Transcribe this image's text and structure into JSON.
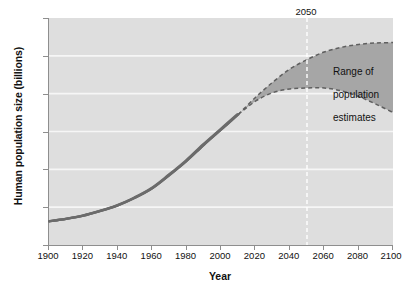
{
  "chart_data": {
    "type": "area",
    "title": "",
    "xlabel": "Year",
    "ylabel": "Human population size (billions)",
    "xlim": [
      1900,
      2100
    ],
    "ylim": [
      0,
      12
    ],
    "xticks": [
      1900,
      1920,
      1940,
      1960,
      1980,
      2000,
      2020,
      2040,
      2060,
      2080,
      2100
    ],
    "yticks": [
      0,
      2,
      4,
      6,
      8,
      10,
      12
    ],
    "grid": "horizontal-white-gridlines",
    "legend": "none",
    "annotations": [
      {
        "name": "marker-2050",
        "text": "2050",
        "x": 2050,
        "style": "white-dashed-vertical-line"
      },
      {
        "name": "range-note",
        "text": "Range of\npopulation\nestimates",
        "x": 2065,
        "y": 9.3
      }
    ],
    "series": [
      {
        "name": "Historical population",
        "style": "solid-dark-line",
        "x": [
          1900,
          1910,
          1920,
          1930,
          1940,
          1950,
          1960,
          1970,
          1980,
          1990,
          2000,
          2010
        ],
        "values": [
          1.25,
          1.38,
          1.55,
          1.8,
          2.1,
          2.5,
          3.0,
          3.7,
          4.45,
          5.3,
          6.1,
          6.9
        ]
      },
      {
        "name": "High estimate",
        "style": "dashed-upper-bound",
        "x": [
          2010,
          2020,
          2030,
          2040,
          2050,
          2060,
          2070,
          2080,
          2090,
          2100
        ],
        "values": [
          6.9,
          7.8,
          8.6,
          9.3,
          9.8,
          10.2,
          10.45,
          10.6,
          10.68,
          10.7
        ]
      },
      {
        "name": "Low estimate",
        "style": "dashed-lower-bound",
        "x": [
          2010,
          2020,
          2030,
          2040,
          2050,
          2060,
          2070,
          2080,
          2090,
          2100
        ],
        "values": [
          6.9,
          7.6,
          8.05,
          8.25,
          8.3,
          8.3,
          8.15,
          7.85,
          7.45,
          7.0
        ]
      }
    ],
    "colors": {
      "plot_background": "#dedede",
      "range_band": "#a8a8a8",
      "line": "#6b6b6b",
      "gridline": "#f4f4f4",
      "axis": "#8e8e8e",
      "text": "#111111"
    }
  },
  "axes": {
    "y_title": "Human population size (billions)",
    "x_title": "Year",
    "y_tick_labels": [
      "12",
      "10",
      "8",
      "6",
      "4",
      "2",
      "0"
    ],
    "x_tick_labels": [
      "1900",
      "1920",
      "1940",
      "1960",
      "1980",
      "2000",
      "2020",
      "2040",
      "2060",
      "2080",
      "2100"
    ]
  },
  "annotations": {
    "year_marker": "2050",
    "range_line1": "Range of",
    "range_line2": "population",
    "range_line3": "estimates"
  }
}
